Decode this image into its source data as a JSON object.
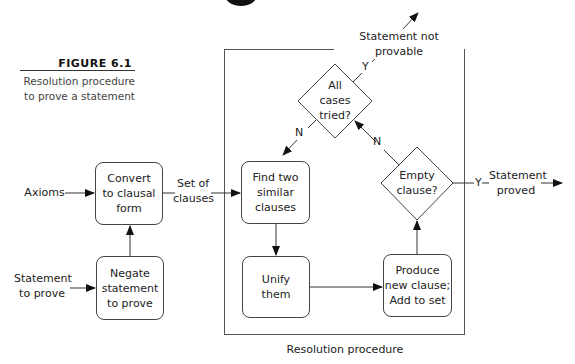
{
  "figure": {
    "label": "FIGURE 6.1",
    "caption_line1": "Resolution procedure",
    "caption_line2": "to prove a statement"
  },
  "inputs": {
    "axioms": "Axioms",
    "statement_line1": "Statement",
    "statement_line2": "to prove"
  },
  "nodes": {
    "convert": [
      "Convert",
      "to clausal",
      "form"
    ],
    "negate": [
      "Negate",
      "statement",
      "to prove"
    ],
    "find": [
      "Find two",
      "similar",
      "clauses"
    ],
    "unify": [
      "Unify",
      "them"
    ],
    "produce": [
      "Produce",
      "new clause;",
      "Add to set"
    ]
  },
  "decisions": {
    "all_cases": [
      "All",
      "cases",
      "tried?"
    ],
    "empty": [
      "Empty",
      "clause?"
    ]
  },
  "edge_labels": {
    "set_of_clauses_line1": "Set of",
    "set_of_clauses_line2": "clauses",
    "yes": "Y",
    "no": "N",
    "not_provable": "Statement not provable",
    "proved_line1": "Statement",
    "proved_line2": "proved"
  },
  "group": {
    "title": "Resolution procedure"
  },
  "colors": {
    "line": "#444444",
    "text": "#222222",
    "background": "#ffffff"
  }
}
